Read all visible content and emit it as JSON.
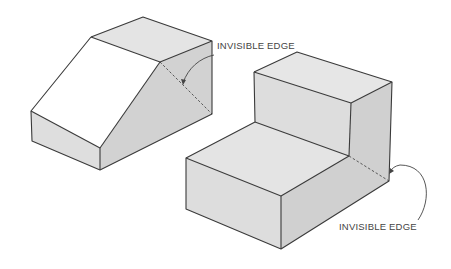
{
  "figure": {
    "background": "#ffffff",
    "colors": {
      "edge": "#3a3a3a",
      "top_face": "#e4e4e4",
      "front_face": "#dcdcdc",
      "side_face": "#cfcfcf",
      "slope_face": "#ffffff",
      "label": "#444444"
    }
  },
  "labels": {
    "left_callout": "INVISIBLE  EDGE",
    "right_callout": "INVISIBLE  EDGE"
  },
  "objects": [
    {
      "name": "wedge-block",
      "description": "Block with inclined face; hidden edge behind right side face"
    },
    {
      "name": "step-block",
      "description": "L-shaped stepped block; hidden edge at lower right rear corner"
    }
  ]
}
